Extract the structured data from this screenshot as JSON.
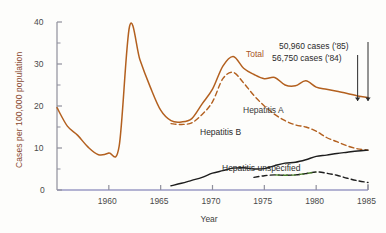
{
  "chart_data": {
    "type": "line",
    "title": "",
    "xlabel": "Year",
    "ylabel": "Cases per 100,000 population",
    "xlim": [
      1955,
      1985
    ],
    "ylim": [
      0,
      40
    ],
    "xticks": [
      "1960",
      "1965",
      "1970",
      "1975",
      "1980",
      "1985"
    ],
    "xtick_values": [
      1960,
      1965,
      1970,
      1975,
      1980,
      1985
    ],
    "yticks": [
      "0",
      "10",
      "20",
      "30",
      "40"
    ],
    "ytick_values": [
      0,
      10,
      20,
      30,
      40
    ],
    "minor_ytick_values": [
      5,
      15,
      25,
      35
    ],
    "grid": false,
    "legend": "inline-labels",
    "series": [
      {
        "name": "Total",
        "label": "Total",
        "color": "#b3601f",
        "style": "solid",
        "x": [
          1955,
          1956,
          1957,
          1958,
          1959,
          1960,
          1961,
          1962,
          1963,
          1964,
          1965,
          1966,
          1967,
          1968,
          1969,
          1970,
          1971,
          1972,
          1973,
          1974,
          1975,
          1976,
          1977,
          1978,
          1979,
          1980,
          1981,
          1982,
          1983,
          1984,
          1985
        ],
        "y": [
          19.6,
          15.2,
          13.0,
          10.2,
          8.4,
          8.8,
          10.5,
          39.0,
          31.0,
          24.5,
          19.0,
          16.5,
          16.2,
          17.0,
          20.5,
          24.0,
          29.5,
          31.8,
          29.0,
          27.5,
          26.5,
          26.8,
          25.0,
          24.8,
          26.0,
          24.5,
          24.0,
          23.5,
          23.0,
          22.4,
          22.0
        ]
      },
      {
        "name": "Hepatitis A",
        "label": "Hepatitis A",
        "color": "#b3601f",
        "style": "dashed",
        "x": [
          1966,
          1967,
          1968,
          1969,
          1970,
          1971,
          1972,
          1973,
          1974,
          1975,
          1976,
          1977,
          1978,
          1979,
          1980,
          1981,
          1982,
          1983,
          1984,
          1985
        ],
        "y": [
          15.8,
          15.6,
          16.0,
          18.0,
          21.0,
          26.5,
          28.0,
          25.5,
          22.5,
          20.0,
          18.0,
          16.5,
          15.5,
          15.0,
          14.0,
          12.5,
          11.5,
          10.5,
          9.8,
          9.5
        ]
      },
      {
        "name": "Hepatitis B",
        "label": "Hepatitis B",
        "color": "#1d1d1d",
        "style": "solid",
        "x": [
          1966,
          1967,
          1968,
          1969,
          1970,
          1971,
          1972,
          1973,
          1974,
          1975,
          1976,
          1977,
          1978,
          1979,
          1980,
          1981,
          1982,
          1983,
          1984,
          1985
        ],
        "y": [
          1.0,
          1.6,
          2.3,
          3.0,
          4.0,
          4.6,
          5.2,
          5.3,
          5.0,
          5.1,
          5.8,
          6.4,
          6.6,
          7.2,
          8.0,
          8.3,
          8.7,
          9.0,
          9.3,
          9.5
        ]
      },
      {
        "name": "Hepatitis unspecified",
        "label": "Hepatitis unspecified",
        "color": "#1d1d1d",
        "accent_color": "#4a7d2c",
        "style": "dashed",
        "x": [
          1974,
          1975,
          1976,
          1977,
          1978,
          1979,
          1980,
          1981,
          1982,
          1983,
          1984,
          1985
        ],
        "y": [
          3.0,
          3.4,
          3.6,
          3.5,
          3.6,
          3.9,
          4.3,
          4.0,
          3.5,
          2.8,
          2.2,
          1.8
        ]
      }
    ],
    "annotations": [
      {
        "text": "50,960 cases ('85)",
        "points_to": 1985
      },
      {
        "text": "56,750 cases ('84)",
        "points_to": 1984
      }
    ]
  },
  "axes": {
    "y_label": "Cases per 100,000 population",
    "x_label": "Year"
  },
  "colors": {
    "total": "#b3601f",
    "hepatitis_a": "#b3601f",
    "hepatitis_b": "#1d1d1d",
    "unspecified_accent": "#4a7d2c",
    "axis": "#8f8f9c",
    "baseline": "#9a9ac4"
  }
}
